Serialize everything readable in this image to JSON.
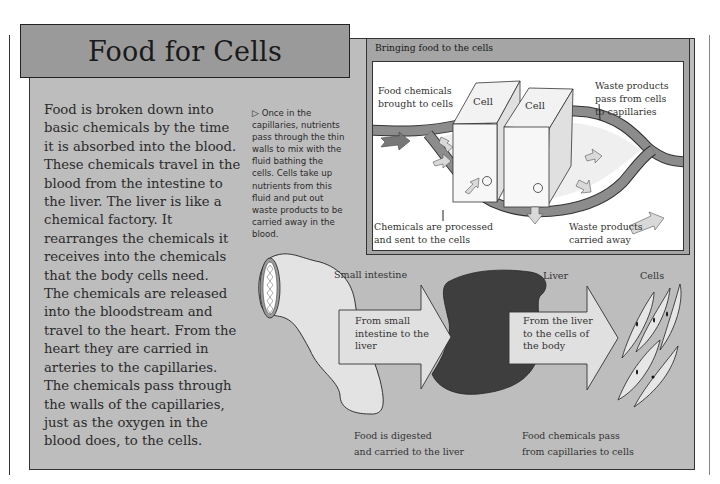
{
  "page": {
    "title": "Food for Cells",
    "body_lines": [
      "Food is broken down into",
      "basic chemicals by the time",
      "it is absorbed into the blood.",
      "These chemicals travel in the",
      "blood from the intestine to",
      "the liver. The liver is like a",
      "chemical factory. It",
      "rearranges the chemicals it",
      "receives into the chemicals",
      "that the body cells need.",
      "The chemicals are released",
      "into the bloodstream and",
      "travel to the heart. From the",
      "heart they are carried in",
      "arteries to the capillaries.",
      "The chemicals pass through",
      "the walls of the capillaries,",
      "just as the oxygen in the",
      "blood does, to the cells."
    ],
    "side_note": {
      "marker": "▷",
      "lines": [
        "Once in the",
        "capillaries, nutrients",
        "pass through the thin",
        "walls to mix with the",
        "fluid bathing the",
        "cells. Cells take up",
        "nutrients from this",
        "fluid and put out",
        "waste products to be",
        "carried away in the",
        "blood."
      ]
    }
  },
  "inset": {
    "title": "Bringing food to the cells",
    "cell_labels": [
      "Cell",
      "Cell"
    ],
    "labels": {
      "food_chemicals": [
        "Food chemicals",
        "brought to cells"
      ],
      "waste_pass": [
        "Waste products",
        "pass from cells",
        "to capillaries"
      ],
      "chemicals_processed": [
        "Chemicals are processed",
        "and sent to the cells"
      ],
      "waste_away": [
        "Waste products",
        "carried away"
      ]
    }
  },
  "pathway": {
    "organs": {
      "small_intestine": "Small intestine",
      "liver": "Liver",
      "cells": "Cells"
    },
    "arrows": {
      "intestine_to_liver": [
        "From small",
        "intestine to the",
        "liver"
      ],
      "liver_to_cells": [
        "From the liver",
        "to the cells of",
        "the body"
      ]
    },
    "captions": {
      "digested": [
        "Food is digested",
        "and carried to the liver"
      ],
      "chemicals_pass": [
        "Food chemicals pass",
        "from capillaries to cells"
      ]
    }
  },
  "colors": {
    "panel": "#bdbdbd",
    "title_bar": "#9a9a9a",
    "inset_frame": "#a5a5a5",
    "capillary": "#8c8c8c",
    "liver": "#3e3e3e",
    "arrow_fill": "#d9d9d9"
  }
}
